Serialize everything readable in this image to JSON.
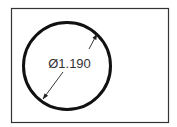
{
  "diagram": {
    "type": "circle-diameter-dimension",
    "dimension_label": "Ø1.190",
    "colors": {
      "frame": "#333333",
      "circle": "#111111",
      "dimension_line": "#222222",
      "text": "#333333",
      "background": "#ffffff"
    }
  }
}
